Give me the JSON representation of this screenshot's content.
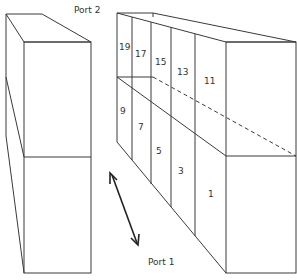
{
  "labels": {
    "port2": "Port 2",
    "port1": "Port 1"
  },
  "cells": [
    {
      "id": "19",
      "x": 120,
      "y": 48
    },
    {
      "id": "17",
      "x": 136,
      "y": 55
    },
    {
      "id": "15",
      "x": 155,
      "y": 63
    },
    {
      "id": "13",
      "x": 177,
      "y": 73
    },
    {
      "id": "11",
      "x": 204,
      "y": 83
    },
    {
      "id": "9",
      "x": 120,
      "y": 114
    },
    {
      "id": "7",
      "x": 137,
      "y": 130
    },
    {
      "id": "5",
      "x": 156,
      "y": 154
    },
    {
      "id": "3",
      "x": 178,
      "y": 174
    },
    {
      "id": "1",
      "x": 208,
      "y": 196
    }
  ],
  "colors": {
    "line": "#3a3a3a",
    "text": "#333333",
    "background": "#ffffff"
  }
}
